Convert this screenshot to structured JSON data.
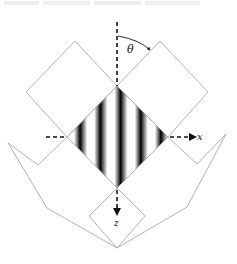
{
  "figure": {
    "type": "geometric optics / interference diagram",
    "labels": {
      "theta": "θ",
      "x_axis": "x",
      "z_axis": "z"
    },
    "colors": {
      "outline": "#9a9a9a",
      "axis": "#111111",
      "fringe_dark": "#000000",
      "fringe_light": "#ffffff"
    },
    "fringes": {
      "count_dark": 5,
      "orientation": "vertical"
    }
  }
}
